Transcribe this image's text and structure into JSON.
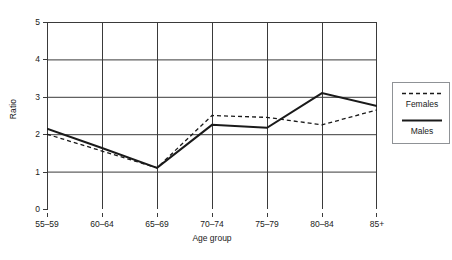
{
  "chart_data": {
    "type": "line",
    "title": "",
    "xlabel": "Age group",
    "ylabel": "Ratio",
    "categories": [
      "55–59",
      "60–64",
      "65–69",
      "70–74",
      "75–79",
      "80–84",
      "85+"
    ],
    "ylim": [
      0,
      5
    ],
    "yticks": [
      "0",
      "1",
      "2",
      "3",
      "4",
      "5"
    ],
    "ytick_values": [
      0,
      1,
      2,
      3,
      4,
      5
    ],
    "grid": "both",
    "legend_position": "right-outside",
    "series": [
      {
        "name": "Females",
        "style": "dashed",
        "color": "#1a1a1a",
        "values": [
          2.0,
          1.55,
          1.1,
          2.5,
          2.45,
          2.25,
          2.65
        ]
      },
      {
        "name": "Males",
        "style": "solid",
        "color": "#1a1a1a",
        "values": [
          2.15,
          1.63,
          1.1,
          2.25,
          2.17,
          3.1,
          2.75
        ]
      }
    ]
  },
  "legend": {
    "items": [
      {
        "label": "Females",
        "style": "dashed"
      },
      {
        "label": "Males",
        "style": "solid"
      }
    ]
  },
  "axes": {
    "y_title": "Ratio",
    "x_title": "Age group"
  },
  "colors": {
    "line": "#1a1a1a",
    "grid": "#3a3a3a",
    "legend_border": "#8f9296",
    "background": "#ffffff"
  }
}
